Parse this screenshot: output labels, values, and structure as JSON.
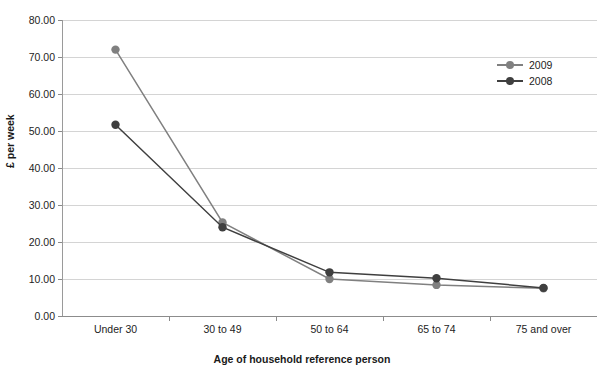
{
  "chart_data": {
    "type": "line",
    "title": "",
    "xlabel": "Age of household reference person",
    "ylabel": "£ per week",
    "categories": [
      "Under 30",
      "30 to 49",
      "50 to 64",
      "65 to 74",
      "75 and over"
    ],
    "series": [
      {
        "name": "2009",
        "color": "#808080",
        "values": [
          72.0,
          25.3,
          10.0,
          8.4,
          7.5
        ]
      },
      {
        "name": "2008",
        "color": "#3f3f3f",
        "values": [
          51.7,
          24.0,
          11.8,
          10.2,
          7.6
        ]
      }
    ],
    "ylim": [
      0.0,
      80.0
    ],
    "ytick_step": 10.0,
    "ytick_labels": [
      "0.00",
      "10.00",
      "20.00",
      "30.00",
      "40.00",
      "50.00",
      "60.00",
      "70.00",
      "80.00"
    ],
    "grid": true,
    "legend_position": "top-right"
  },
  "axes": {
    "y_title": "£ per week",
    "x_title": "Age of household reference person"
  },
  "legend": {
    "items": [
      {
        "label": "2009"
      },
      {
        "label": "2008"
      }
    ]
  },
  "colors": {
    "series_2009": "#808080",
    "series_2008": "#3f3f3f",
    "gridline": "#d4d4d4",
    "axis": "#8a8a8a",
    "text": "#232323",
    "background": "#ffffff"
  }
}
